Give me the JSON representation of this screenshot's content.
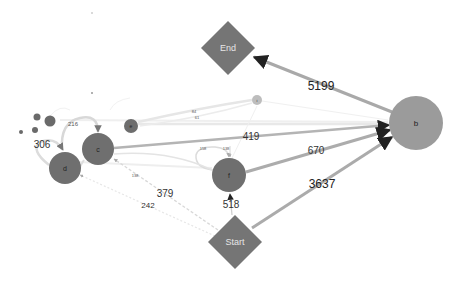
{
  "diagram": {
    "type": "process-flow-graph",
    "colors": {
      "node_dark": "#6f6f6f",
      "node_b": "#9a9a9a",
      "node_i": "#bcbcbc",
      "edge_strong": "#a8a8a8",
      "edge_light": "#e0e0e0",
      "edge_faint": "#ececec",
      "diamond": "#757575",
      "arrow": "#222222"
    },
    "nodes": {
      "start": {
        "label": "Start"
      },
      "end": {
        "label": "End"
      },
      "b": {
        "label": "b"
      },
      "c": {
        "label": "c"
      },
      "d": {
        "label": "d"
      },
      "e": {
        "label": "e"
      },
      "f": {
        "label": "f"
      },
      "i": {
        "label": "i"
      }
    },
    "edges": {
      "b_end": {
        "from": "b",
        "to": "End",
        "label": "5199"
      },
      "start_b": {
        "from": "Start",
        "to": "b",
        "label": "3637"
      },
      "f_b": {
        "from": "f",
        "to": "b",
        "label": "670"
      },
      "c_b": {
        "from": "c",
        "to": "b",
        "label": "419"
      },
      "start_f": {
        "from": "Start",
        "to": "f",
        "label": "518"
      },
      "start_c": {
        "from": "Start",
        "to": "c",
        "label": "379"
      },
      "start_d": {
        "from": "Start",
        "to": "d",
        "label": "242"
      },
      "d_loop": {
        "from": "d",
        "to": "d",
        "label": "306"
      },
      "d_c": {
        "from": "d",
        "to": "c",
        "label": "216"
      },
      "f_loop": {
        "from": "f",
        "to": "f",
        "label": "158"
      },
      "f_in_small": {
        "label": "138"
      },
      "c_small": {
        "label": "138"
      },
      "e_i_1": {
        "label": "84"
      },
      "e_i_2": {
        "label": "61"
      }
    }
  }
}
